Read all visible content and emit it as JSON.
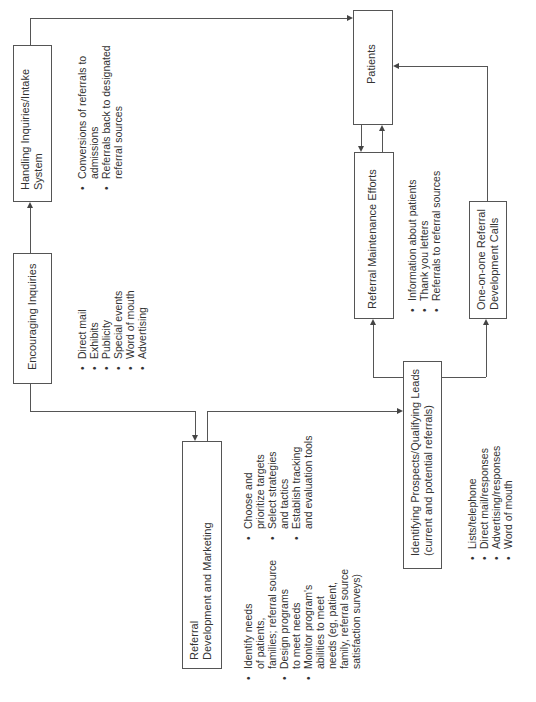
{
  "diagram": {
    "orientation": "rotated-90-ccw",
    "nodes": {
      "handling": {
        "title_lines": [
          "Handling Inquiries/Intake",
          "System"
        ],
        "bullets": [
          [
            "Conversions of referrals to",
            "admissions"
          ],
          [
            "Referrals back to designated",
            "referral sources"
          ]
        ]
      },
      "encouraging": {
        "title_lines": [
          "Encouraging Inquiries"
        ],
        "bullets": [
          [
            "Direct mail"
          ],
          [
            "Exhibits"
          ],
          [
            "Publicity"
          ],
          [
            "Special events"
          ],
          [
            "Word of mouth"
          ],
          [
            "Advertising"
          ]
        ]
      },
      "referral_dev": {
        "title_lines": [
          "Referral",
          "Development and Marketing"
        ],
        "bullets_col1": [
          [
            "Identify needs",
            "of patients,",
            "families; referral source"
          ],
          [
            "Design programs",
            "to meet needs"
          ],
          [
            "Monitor program's",
            "abilities to meet",
            "needs (eg, patient,",
            "family, referral source",
            "satisfaction surveys)"
          ]
        ],
        "bullets_col2": [
          [
            "Choose and",
            "prioritize targets"
          ],
          [
            "Select strategies",
            "and tactics"
          ],
          [
            "Establish tracking",
            "and evaluation tools"
          ]
        ]
      },
      "identifying": {
        "title_lines": [
          "Identifying Prospects/Qualifying Leads",
          "(current and potential referrals)"
        ],
        "bullets": [
          [
            "Lists/telephone"
          ],
          [
            "Direct mail/responses"
          ],
          [
            "Advertising/responses"
          ],
          [
            "Word of mouth"
          ]
        ]
      },
      "maintenance": {
        "title_lines": [
          "Referral Maintenance Efforts"
        ],
        "bullets": [
          [
            "Information about patients"
          ],
          [
            "Thank you letters"
          ],
          [
            "Referrals to referral sources"
          ]
        ]
      },
      "one_on_one": {
        "title_lines": [
          "One-on-one Referral",
          "Development Calls"
        ]
      },
      "patients": {
        "title_lines": [
          "Patients"
        ]
      }
    },
    "edges": [
      {
        "from": "Encouraging Inquiries",
        "to": "Handling Inquiries/Intake System"
      },
      {
        "from": "Handling Inquiries/Intake System",
        "to": "Patients"
      },
      {
        "from": "Encouraging Inquiries",
        "to": "Referral Development and Marketing"
      },
      {
        "from": "Referral Development and Marketing",
        "to": "Identifying Prospects/Qualifying Leads"
      },
      {
        "from": "Identifying Prospects/Qualifying Leads",
        "to": "Referral Maintenance Efforts"
      },
      {
        "from": "Identifying Prospects/Qualifying Leads",
        "to": "One-on-one Referral Development Calls"
      },
      {
        "from": "Referral Maintenance Efforts",
        "to": "Patients"
      },
      {
        "from": "Patients",
        "to": "Referral Maintenance Efforts"
      },
      {
        "from": "One-on-one Referral Development Calls",
        "to": "Patients"
      }
    ],
    "colors": {
      "line": "#555555",
      "text": "#333333",
      "background": "#ffffff"
    }
  }
}
